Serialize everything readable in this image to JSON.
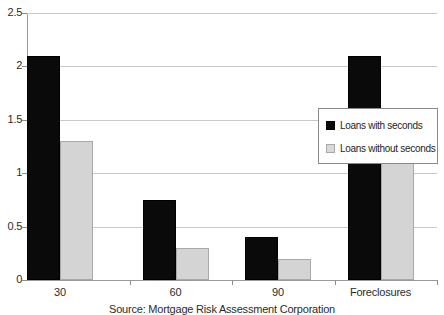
{
  "chart_data": {
    "type": "bar",
    "title": "",
    "xlabel": "",
    "ylabel": "",
    "categories": [
      "30",
      "60",
      "90",
      "Foreclosures"
    ],
    "series": [
      {
        "name": "Loans with seconds",
        "color": "#000000",
        "values": [
          2.1,
          0.75,
          0.4,
          2.1
        ]
      },
      {
        "name": "Loans without seconds",
        "color": "#d4d4d4",
        "values": [
          1.3,
          0.3,
          0.2,
          1.27
        ]
      }
    ],
    "ylim": [
      0,
      2.5
    ],
    "yticks": [
      "0",
      "0.5",
      "1",
      "1.5",
      "2",
      "2.5"
    ],
    "ytick_values": [
      0,
      0.5,
      1,
      1.5,
      2,
      2.5
    ],
    "grid": true,
    "legend_position": "right",
    "caption": "Source: Mortgage Risk Assessment Corporation"
  }
}
